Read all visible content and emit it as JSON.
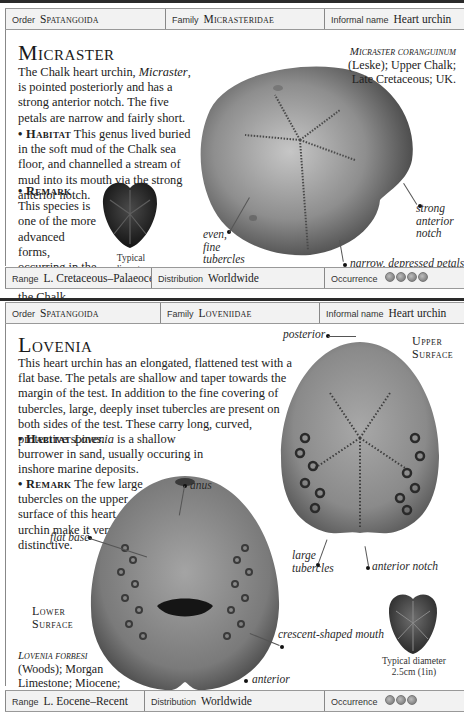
{
  "entries": [
    {
      "header": {
        "order_label": "Order",
        "order_value": "Spatangoida",
        "family_label": "Family",
        "family_value": "Micrasteridae",
        "informal_label": "Informal name",
        "informal_value": "Heart urchin"
      },
      "title": "Micraster",
      "description": {
        "intro_pre": "The Chalk heart urchin, ",
        "intro_genus": "Micraster",
        "intro_post": ", is pointed posteriorly and has a strong anterior notch. The five petals are narrow and fairly short.",
        "habitat_heading": "• Habitat",
        "habitat_text": " This genus lived buried in the soft mud of the Chalk sea floor, and channelled a stream of mud into its mouth via the strong anterior notch.",
        "remark_heading": "• Remark",
        "remark_text": "This species is one of the more advanced forms, occurring in the higher beds of the Chalk."
      },
      "specimen_caption": {
        "species": "Micraster coranguinum",
        "details": "(Leske); Upper Chalk; Late Cretaceous; UK."
      },
      "annotations": {
        "even_fine_tubercles": "even, fine tubercles",
        "strong_anterior_notch": "strong anterior notch",
        "narrow_depressed_petals": "narrow, depressed petals"
      },
      "typical_diameter": {
        "label": "Typical diameter",
        "value": "5cm (2in)"
      },
      "footer": {
        "range_label": "Range",
        "range_value": "L. Cretaceous–Palaeocene",
        "distribution_label": "Distribution",
        "distribution_value": "Worldwide",
        "occurrence_label": "Occurrence",
        "occurrence_count": 4
      }
    },
    {
      "header": {
        "order_label": "Order",
        "order_value": "Spatangoida",
        "family_label": "Family",
        "family_value": "Loveniidae",
        "informal_label": "Informal name",
        "informal_value": "Heart urchin"
      },
      "title": "Lovenia",
      "description": {
        "intro": "This heart urchin has an elongated, flattened test with a flat base. The petals are shallow and taper towards the margin of the test. In addition to the fine covering of tubercles, large, deeply inset tubercles are present on both sides of the test. These carry long, curved, protective spines.",
        "habitat_heading": "• Habitat",
        "habitat_genus": "Lovenia",
        "habitat_text": " is a shallow burrower in sand, usually occuring in inshore marine deposits.",
        "remark_heading": "• Remark",
        "remark_text": " The few large tubercles on the upper surface of this heart urchin make it very distinctive."
      },
      "specimen_caption": {
        "species": "Lovenia forbesi",
        "details": "(Woods); Morgan Limestone; Miocene; South Australia."
      },
      "surface_labels": {
        "upper": "Upper Surface",
        "lower": "Lower Surface"
      },
      "annotations": {
        "posterior": "posterior",
        "anus": "anus",
        "flat_base": "flat base",
        "large_tubercles": "large tubercles",
        "anterior_notch": "anterior notch",
        "crescent_shaped_mouth": "crescent-shaped mouth",
        "anterior": "anterior"
      },
      "typical_diameter": {
        "label": "Typical diameter",
        "value": "2.5cm (1in)"
      },
      "footer": {
        "range_label": "Range",
        "range_value": "L. Eocene–Recent",
        "distribution_label": "Distribution",
        "distribution_value": "Worldwide",
        "occurrence_label": "Occurrence",
        "occurrence_count": 3
      }
    }
  ],
  "colors": {
    "bar_background": "#f2f2f2",
    "rule": "#2a2a2a",
    "text": "#1e1e1e"
  }
}
